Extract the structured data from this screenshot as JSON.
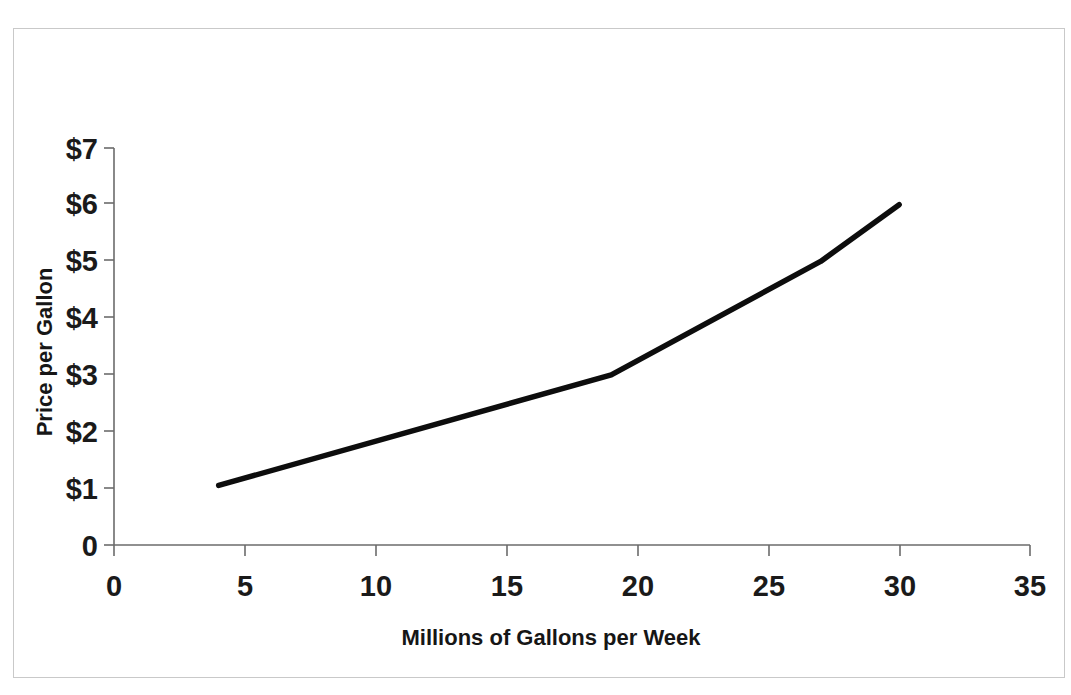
{
  "chart_data": {
    "type": "line",
    "title": "",
    "subtitle": "",
    "xlabel": "Millions of Gallons per Week",
    "ylabel": "Price per Gallon",
    "xlim": [
      0,
      35
    ],
    "ylim": [
      0,
      7
    ],
    "grid": false,
    "legend": null,
    "line_color": "#0d0d0d",
    "axis_color": "#6b6b6b",
    "background_color": "#ffffff",
    "x_ticks": [
      {
        "value": 0,
        "label": "0"
      },
      {
        "value": 5,
        "label": "5"
      },
      {
        "value": 10,
        "label": "10"
      },
      {
        "value": 15,
        "label": "15"
      },
      {
        "value": 20,
        "label": "20"
      },
      {
        "value": 25,
        "label": "25"
      },
      {
        "value": 30,
        "label": "30"
      },
      {
        "value": 35,
        "label": "35"
      }
    ],
    "y_ticks": [
      {
        "value": 0,
        "label": "0"
      },
      {
        "value": 1,
        "label": "$1"
      },
      {
        "value": 2,
        "label": "$2"
      },
      {
        "value": 3,
        "label": "$3"
      },
      {
        "value": 4,
        "label": "$4"
      },
      {
        "value": 5,
        "label": "$5"
      },
      {
        "value": 6,
        "label": "$6"
      },
      {
        "value": 7,
        "label": "$7"
      }
    ],
    "series": [
      {
        "name": "Supply",
        "x": [
          4,
          19,
          27,
          30
        ],
        "y": [
          1.05,
          3.0,
          5.0,
          6.0
        ]
      }
    ]
  }
}
